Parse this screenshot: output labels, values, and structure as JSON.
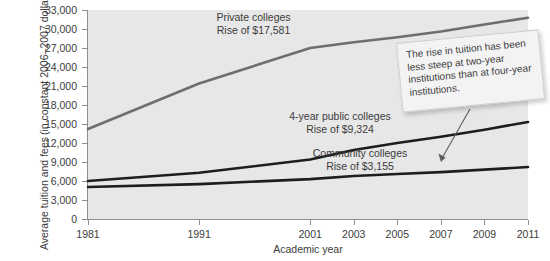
{
  "chart_data": {
    "type": "line",
    "title": "",
    "xlabel": "Academic year",
    "ylabel_line1": "Average tuition and fees",
    "ylabel_line2": "(in constant 2006–2007 dollars)",
    "x": [
      1981,
      1991,
      2001,
      2003,
      2005,
      2007,
      2009,
      2011
    ],
    "xtick_labels": [
      "1981",
      "1991",
      "2001",
      "2003",
      "2005",
      "2007",
      "2009",
      "2011"
    ],
    "ytick_labels": [
      "33,000",
      "30,000",
      "27,000",
      "24,000",
      "21,000",
      "18,000",
      "15,000",
      "12,000",
      "9,000",
      "6,000",
      "3,000",
      "0"
    ],
    "ytick_values": [
      33000,
      30000,
      27000,
      24000,
      21000,
      18000,
      15000,
      12000,
      9000,
      6000,
      3000,
      0
    ],
    "ylim": [
      0,
      33000
    ],
    "grid": false,
    "legend_position": "inline-annotations",
    "series": [
      {
        "name": "Private colleges",
        "color": "#6e6e6e",
        "values": [
          14200,
          21400,
          27000,
          27900,
          28700,
          29600,
          30700,
          31781
        ],
        "rise_label": "Rise of $17,581",
        "rise_value": 17581
      },
      {
        "name": "4-year public colleges",
        "color": "#1d1d1d",
        "values": [
          6000,
          7300,
          9400,
          10900,
          12000,
          13000,
          14100,
          15324
        ],
        "rise_label": "Rise of $9,324",
        "rise_value": 9324
      },
      {
        "name": "Community colleges",
        "color": "#1d1d1d",
        "values": [
          5050,
          5500,
          6300,
          6800,
          7100,
          7400,
          7800,
          8205
        ],
        "rise_label": "Rise of $3,155",
        "rise_value": 3155
      }
    ],
    "annotations": [
      {
        "id": "private-note",
        "line1": "Private colleges",
        "line2": "Rise of $17,581"
      },
      {
        "id": "public-note",
        "line1": "4-year public colleges",
        "line2": "Rise of $9,324"
      },
      {
        "id": "community-note",
        "line1": "Community colleges",
        "line2": "Rise of $3,155"
      }
    ],
    "callout": {
      "text": "The rise in tuition has been less steep at two-year institutions than at four-year institutions.",
      "points_to": "Community colleges"
    },
    "colors": {
      "plot_background": "#e7e7e7",
      "page_background": "#ffffff",
      "axis": "#8d8d8d",
      "text": "#3b3b3b",
      "private_line": "#6e6e6e",
      "public_line": "#1d1d1d",
      "community_line": "#1d1d1d",
      "callout_background": "#f3f3f3",
      "callout_border": "#cfcfcf"
    }
  }
}
